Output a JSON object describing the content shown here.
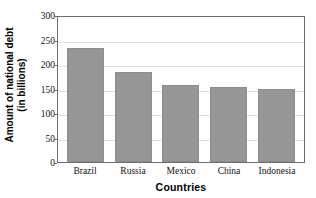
{
  "chart_data": {
    "type": "bar",
    "title": "",
    "categories": [
      "Brazil",
      "Russia",
      "Mexico",
      "China",
      "Indonesia"
    ],
    "values": [
      232,
      183,
      158,
      154,
      149
    ],
    "xlabel": "Countries",
    "ylabel": "Amount of national debt (in billions)",
    "ylabel_line1": "Amount of national debt",
    "ylabel_line2": "(in billions)",
    "ylim": [
      0,
      300
    ],
    "yticks": [
      300,
      250,
      200,
      150,
      100,
      50,
      0
    ],
    "ytick_labels": [
      "300",
      "250",
      "200",
      "150",
      "100",
      "50",
      "0"
    ],
    "grid": true,
    "legend": false,
    "bar_color": "#969696",
    "gridline_color": "#dedede",
    "axis_color": "#6e6e6e",
    "background_color": "#ffffff"
  }
}
